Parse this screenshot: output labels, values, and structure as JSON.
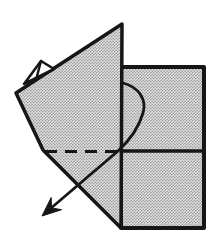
{
  "meta": {
    "type": "origami-fold-step-diagram"
  },
  "canvas": {
    "width": 214,
    "height": 236,
    "viewbox": "0 0 214 236",
    "background": "#ffffff"
  },
  "colors": {
    "outline": "#161616",
    "arrow": "#161616",
    "paper_pattern_base": "#e2e2e2",
    "paper_pattern_dot": "#969696",
    "pleat_fill": "#ffffff"
  },
  "shapes": {
    "square_sheet": {
      "path": "M121 67 L204 67 L204 228 L121 228 Z",
      "stroke_width": 4
    },
    "horizontal_crease": {
      "path": "M121 151 L204 151",
      "stroke_width": 3.5
    },
    "folded_flap": {
      "path": "M122 24 L16 93 L43 150 L121 228 Z",
      "stroke_width": 3.5
    },
    "corner_pleat": {
      "path": "M24 84 L41 61 L54 69 Z",
      "stroke_width": 2.6
    },
    "corner_pleat_crease": {
      "path": "M41 61 L36 80",
      "stroke_width": 2.4
    },
    "dashed_fold_line": {
      "path": "M45 151.5 L119 151.5",
      "stroke_width": 3,
      "dash": "12 8"
    },
    "arrow_curve": {
      "path": "M123 83 C139 87 147 100 143 113 C139 127 130 140 118 151 L50 209",
      "stroke_width": 2.8
    },
    "arrow_head": {
      "path": "M42 216 L51.2 197.5 L51.5 207.9 L61.6 209.7 Z"
    }
  }
}
